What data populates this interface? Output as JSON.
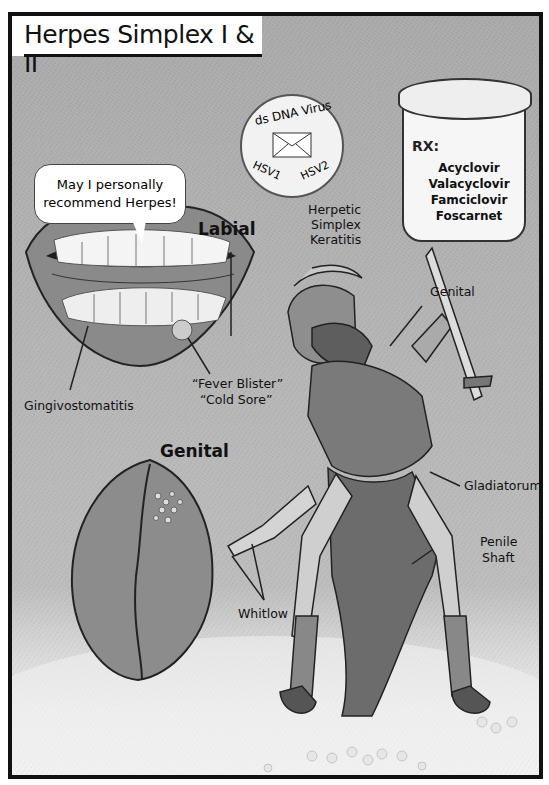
{
  "title": "Herpes Simplex I & II",
  "speech_bubble": {
    "line1": "May I personally",
    "line2": "recommend Herpes!"
  },
  "virus_badge": {
    "top_text": "ds DNA Virus",
    "bottom_left": "HSV1",
    "bottom_right": "HSV2",
    "icon": "envelope-icon"
  },
  "rx_bottle": {
    "header": "RX:",
    "drugs": [
      "Acyclovir",
      "Valacyclovir",
      "Famciclovir",
      "Foscarnet"
    ]
  },
  "sections": {
    "labial": "Labial",
    "genital": "Genital"
  },
  "labels": {
    "gingivostomatitis": "Gingivostomatitis",
    "fever_blister": "“Fever Blister”",
    "cold_sore": "“Cold Sore”",
    "keratitis_1": "Herpetic",
    "keratitis_2": "Simplex",
    "keratitis_3": "Keratitis",
    "genital_gladiator": "Genital",
    "gladiatorum": "Gladiatorum",
    "penile_1": "Penile",
    "penile_2": "Shaft",
    "whitlow": "Whitlow"
  },
  "colors": {
    "frame": "#111111",
    "background": "#b3b3b3",
    "floor": "#eeeeee"
  }
}
